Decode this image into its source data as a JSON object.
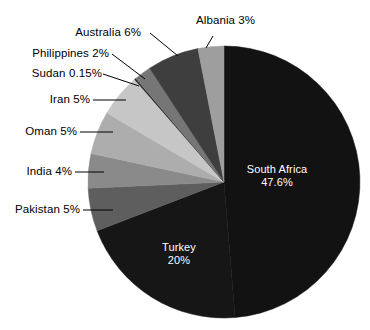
{
  "chart_data": {
    "type": "pie",
    "title": "",
    "subtitle": "",
    "xlabel": "",
    "ylabel": "",
    "legend_position": "none",
    "grid": false,
    "start_angle_deg": 0,
    "direction": "clockwise",
    "categories": [
      "South Africa",
      "Turkey",
      "Pakistan",
      "India",
      "Oman",
      "Iran",
      "Sudan",
      "Philippines",
      "Australia",
      "Albania"
    ],
    "values": [
      47.6,
      20,
      5,
      4,
      5,
      5,
      0.15,
      2,
      6,
      3
    ],
    "slices": [
      {
        "name": "South Africa",
        "value": 47.6,
        "label": "South Africa",
        "pct_label": "47.6%",
        "color": "#121212",
        "label_placement": "inside",
        "label_color": "#ffffff"
      },
      {
        "name": "Turkey",
        "value": 20,
        "label": "Turkey",
        "pct_label": "20%",
        "color": "#161616",
        "label_placement": "inside",
        "label_color": "#ffffff"
      },
      {
        "name": "Pakistan",
        "value": 5,
        "label": "Pakistan 5%",
        "pct_label": "5%",
        "color": "#5e5e5e",
        "label_placement": "outside",
        "label_color": "#000000"
      },
      {
        "name": "India",
        "value": 4,
        "label": "India 4%",
        "pct_label": "4%",
        "color": "#8a8a8a",
        "label_placement": "outside",
        "label_color": "#000000"
      },
      {
        "name": "Oman",
        "value": 5,
        "label": "Oman 5%",
        "pct_label": "5%",
        "color": "#adadad",
        "label_placement": "outside",
        "label_color": "#000000"
      },
      {
        "name": "Iran",
        "value": 5,
        "label": "Iran 5%",
        "pct_label": "5%",
        "color": "#c6c6c6",
        "label_placement": "outside",
        "label_color": "#000000"
      },
      {
        "name": "Sudan",
        "value": 0.15,
        "label": "Sudan 0.15%",
        "pct_label": "0.15%",
        "color": "#1c1c1c",
        "label_placement": "outside",
        "label_color": "#000000"
      },
      {
        "name": "Philippines",
        "value": 2,
        "label": "Philippines 2%",
        "pct_label": "2%",
        "color": "#767676",
        "label_placement": "outside",
        "label_color": "#000000"
      },
      {
        "name": "Australia",
        "value": 6,
        "label": "Australia 6%",
        "pct_label": "6%",
        "color": "#3e3e3e",
        "label_placement": "outside",
        "label_color": "#000000"
      },
      {
        "name": "Albania",
        "value": 3,
        "label": "Albania 3%",
        "pct_label": "3%",
        "color": "#9e9e9e",
        "label_placement": "outside",
        "label_color": "#000000"
      }
    ]
  },
  "labels": {
    "albania": "Albania 3%",
    "australia": "Australia 6%",
    "philippines": "Philippines 2%",
    "sudan": "Sudan 0.15%",
    "iran": "Iran 5%",
    "oman": "Oman 5%",
    "india": "India 4%",
    "pakistan": "Pakistan 5%",
    "south_africa_name": "South Africa",
    "south_africa_pct": "47.6%",
    "turkey_name": "Turkey",
    "turkey_pct": "20%"
  },
  "colors": {
    "background": "#ffffff",
    "outline": "#000000",
    "text": "#000000",
    "inner_text": "#ffffff"
  }
}
